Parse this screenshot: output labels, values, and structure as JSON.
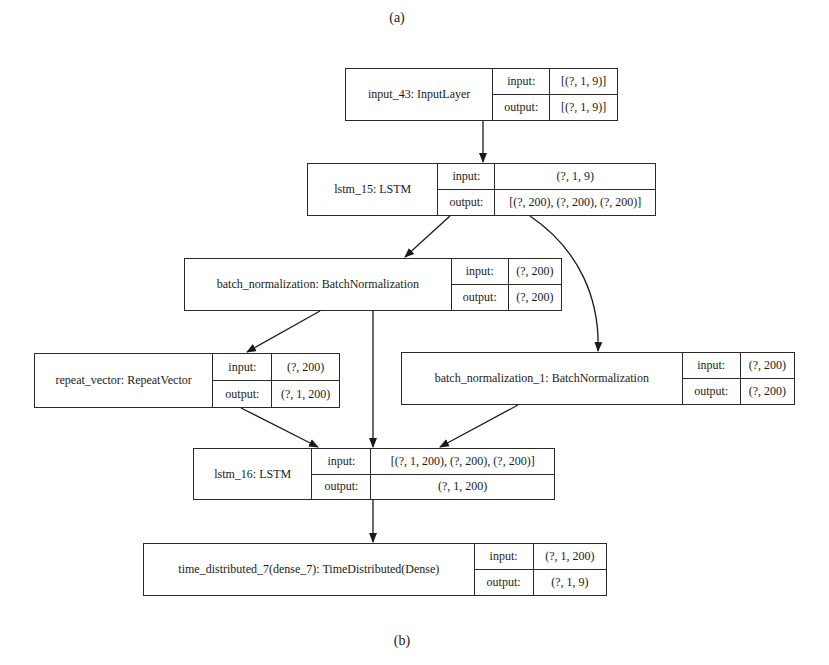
{
  "captions": {
    "top": "(a)",
    "bottom": "(b)"
  },
  "port_labels": {
    "input": "input:",
    "output": "output:"
  },
  "nodes": [
    {
      "id": "input_43",
      "name": "input_43: InputLayer",
      "input": "[(?, 1, 9)]",
      "output": "[(?, 1, 9)]"
    },
    {
      "id": "lstm_15",
      "name": "lstm_15: LSTM",
      "input": "(?, 1, 9)",
      "output": "[(?, 200), (?, 200), (?, 200)]"
    },
    {
      "id": "batch_normalization",
      "name": "batch_normalization: BatchNormalization",
      "input": "(?, 200)",
      "output": "(?, 200)"
    },
    {
      "id": "repeat_vector",
      "name": "repeat_vector: RepeatVector",
      "input": "(?, 200)",
      "output": "(?, 1, 200)"
    },
    {
      "id": "batch_normalization_1",
      "name": "batch_normalization_1: BatchNormalization",
      "input": "(?, 200)",
      "output": "(?, 200)"
    },
    {
      "id": "lstm_16",
      "name": "lstm_16: LSTM",
      "input": "[(?, 1, 200), (?, 200), (?, 200)]",
      "output": "(?, 1, 200)"
    },
    {
      "id": "time_distributed_7",
      "name": "time_distributed_7(dense_7): TimeDistributed(Dense)",
      "input": "(?, 1, 200)",
      "output": "(?, 1, 9)"
    }
  ],
  "edges": [
    {
      "from": "input_43",
      "to": "lstm_15"
    },
    {
      "from": "lstm_15",
      "to": "batch_normalization"
    },
    {
      "from": "lstm_15",
      "to": "batch_normalization_1"
    },
    {
      "from": "batch_normalization",
      "to": "repeat_vector"
    },
    {
      "from": "batch_normalization",
      "to": "lstm_16"
    },
    {
      "from": "repeat_vector",
      "to": "lstm_16"
    },
    {
      "from": "batch_normalization_1",
      "to": "lstm_16"
    },
    {
      "from": "lstm_16",
      "to": "time_distributed_7"
    }
  ]
}
